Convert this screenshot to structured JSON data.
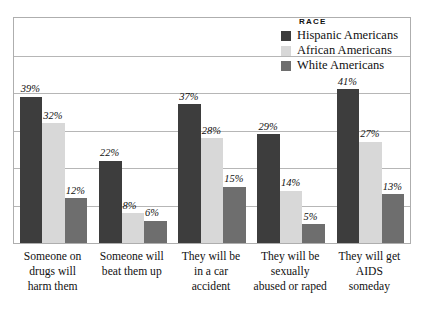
{
  "chart_data": {
    "type": "bar",
    "title": "",
    "subtitle": "",
    "xlabel": "",
    "ylabel": "",
    "ylim": [
      0,
      60
    ],
    "grid": true,
    "legend_position": "top-right",
    "legend_title": "RACE",
    "categories": [
      "Someone on drugs will harm them",
      "Someone will beat them up",
      "They will be in a car accident",
      "They will be sexually abused or raped",
      "They will get AIDS someday"
    ],
    "category_lines": [
      [
        "Someone on",
        "drugs will",
        "harm them"
      ],
      [
        "Someone will",
        "beat them up"
      ],
      [
        "They will be",
        "in a car",
        "accident"
      ],
      [
        "They will be",
        "sexually",
        "abused or raped"
      ],
      [
        "They will get",
        "AIDS",
        "someday"
      ]
    ],
    "series": [
      {
        "name": "Hispanic Americans",
        "color": "#3d3d3d",
        "values": [
          39,
          22,
          37,
          29,
          41
        ],
        "labels": [
          "39%",
          "22%",
          "37%",
          "29%",
          "41%"
        ]
      },
      {
        "name": "African Americans",
        "color": "#d8d8d8",
        "values": [
          32,
          8,
          28,
          14,
          27
        ],
        "labels": [
          "32%",
          "8%",
          "28%",
          "14%",
          "27%"
        ]
      },
      {
        "name": "White Americans",
        "color": "#6e6e6e",
        "values": [
          12,
          6,
          15,
          5,
          13
        ],
        "labels": [
          "12%",
          "6%",
          "15%",
          "5%",
          "13%"
        ]
      }
    ],
    "gridline_count": 6,
    "colors": {
      "frame": "#aeaeae",
      "gridline": "#b6b6b6",
      "background": "#ffffff",
      "text": "#111111"
    }
  }
}
